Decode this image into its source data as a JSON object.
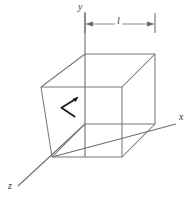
{
  "figure": {
    "background_color": "#ffffff",
    "line_color": "#767676",
    "axis_color": "#6e6e6e",
    "marker_color": "#1d1d1d",
    "text_color": "#3a3a3a"
  },
  "axes": {
    "y": {
      "label": "y",
      "direction": "up",
      "label_position": {
        "x": 78,
        "y": 2
      }
    },
    "x": {
      "label": "x",
      "direction": "right",
      "label_position": {
        "x": 179,
        "y": 112
      }
    },
    "z": {
      "label": "z",
      "direction": "down-left",
      "label_position": {
        "x": 8,
        "y": 181
      }
    }
  },
  "dimension": {
    "label": "l",
    "label_position": {
      "x": 115,
      "y": 16
    },
    "start_x": 85,
    "end_x": 155,
    "line_y": 24,
    "tick_top": 13,
    "tick_bottom": 33,
    "arrows": "both-ends"
  },
  "cube": {
    "edge_label": "l",
    "front_face": {
      "top_left": {
        "x": 41,
        "y": 87
      },
      "top_right": {
        "x": 122,
        "y": 87
      },
      "bottom_right": {
        "x": 122,
        "y": 157
      },
      "bottom_left": {
        "x": 52,
        "y": 157
      }
    },
    "back_face": {
      "top_left": {
        "x": 85,
        "y": 54
      },
      "top_right": {
        "x": 155,
        "y": 54
      },
      "bottom_right": {
        "x": 155,
        "y": 124
      },
      "bottom_left": {
        "x": 85,
        "y": 124
      }
    }
  },
  "marker": {
    "name": "arrow-marker",
    "description": "small left-pointing arrow drawn on the left side face of the cube",
    "tip": {
      "x": 61,
      "y": 108
    },
    "upper_tail": {
      "x": 76,
      "y": 99
    },
    "lower_tail": {
      "x": 74,
      "y": 117
    }
  }
}
